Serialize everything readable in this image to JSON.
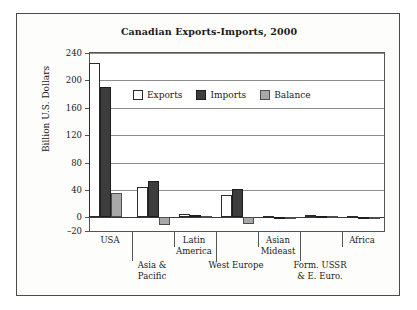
{
  "figure": {
    "border_color": "#4a4a4a",
    "background": "#ffffff"
  },
  "chart_data": {
    "type": "bar",
    "title": "Canadian Exports-Imports, 2000",
    "xlabel": "",
    "ylabel": "Billion U.S. Dollars",
    "ylim": [
      -20,
      240
    ],
    "yticks": [
      -20,
      0,
      40,
      80,
      120,
      160,
      200,
      240
    ],
    "ytick_labels": [
      "–20",
      "0",
      "40",
      "80",
      "120",
      "160",
      "200",
      "240"
    ],
    "grid": true,
    "grid_axis": "y",
    "legend_position": "upper center inside",
    "categories": [
      "USA",
      "Asia & Pacific",
      "Latin America",
      "West Europe",
      "Asian Mideast",
      "Form. USSR & E. Euro.",
      "Africa"
    ],
    "category_lines": [
      [
        "USA"
      ],
      [
        "Asia &",
        "Pacific"
      ],
      [
        "Latin",
        "America"
      ],
      [
        "West Europe"
      ],
      [
        "Asian",
        "Mideast"
      ],
      [
        "Form. USSR",
        "& E. Euro."
      ],
      [
        "Africa"
      ]
    ],
    "series": [
      {
        "name": "Exports",
        "color": "#ffffff",
        "edge_color": "#2b2b2b",
        "values": [
          225,
          44,
          5,
          32,
          1.5,
          3,
          1.5
        ]
      },
      {
        "name": "Imports",
        "color": "#3d3d3d",
        "edge_color": "#1d1d1d",
        "values": [
          191,
          53,
          3,
          41,
          1,
          1.5,
          1
        ]
      },
      {
        "name": "Balance",
        "color": "#a8a8a8",
        "edge_color": "#4d4d4d",
        "values": [
          36,
          -11,
          2,
          -10,
          0.5,
          1.5,
          1
        ]
      }
    ]
  }
}
